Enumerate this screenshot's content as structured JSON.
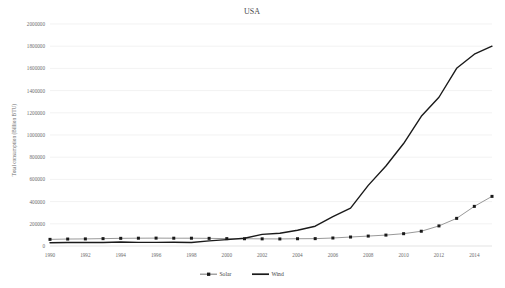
{
  "chart_data": {
    "type": "line",
    "title": "USA",
    "xlabel": "",
    "ylabel": "Total consumption (Billion BTU)",
    "x": [
      1990,
      1991,
      1992,
      1993,
      1994,
      1995,
      1996,
      1997,
      1998,
      1999,
      2000,
      2001,
      2002,
      2003,
      2004,
      2005,
      2006,
      2007,
      2008,
      2009,
      2010,
      2011,
      2012,
      2013,
      2014,
      2015
    ],
    "xtick_labels": [
      "1990",
      "1992",
      "1994",
      "1996",
      "1998",
      "2000",
      "2002",
      "2004",
      "2006",
      "2008",
      "2010",
      "2012",
      "2014"
    ],
    "ytick_labels": [
      "0",
      "200000",
      "400000",
      "600000",
      "800000",
      "1000000",
      "1200000",
      "1400000",
      "1600000",
      "1800000",
      "2000000"
    ],
    "ytick_values": [
      0,
      200000,
      400000,
      600000,
      800000,
      1000000,
      1200000,
      1400000,
      1600000,
      1800000,
      2000000
    ],
    "ylim": [
      0,
      2000000
    ],
    "xlim": [
      1990,
      2015
    ],
    "grid": true,
    "legend_position": "bottom",
    "series": [
      {
        "name": "Solar",
        "color": "#8c8c8c",
        "marker": "square",
        "marker_color": "#1a1a1a",
        "line_width": 0.9,
        "values": [
          59718,
          62688,
          63886,
          66388,
          69040,
          70237,
          71080,
          70237,
          70185,
          68793,
          66388,
          65454,
          64391,
          63595,
          65454,
          66388,
          72000,
          80906,
          89429,
          98263,
          111000,
          133000,
          181000,
          249000,
          357000,
          447000
        ]
      },
      {
        "name": "Wind",
        "color": "#1a1a1a",
        "marker": "none",
        "marker_color": "#1a1a1a",
        "line_width": 1.4,
        "values": [
          29000,
          31000,
          33000,
          31000,
          36000,
          33000,
          33000,
          34000,
          31000,
          46000,
          57000,
          70000,
          105000,
          115000,
          142000,
          178000,
          264000,
          341000,
          546000,
          721000,
          923000,
          1168000,
          1340000,
          1601000,
          1728000,
          1800000
        ]
      }
    ]
  },
  "legend": {
    "items": [
      {
        "label": "Solar"
      },
      {
        "label": "Wind"
      }
    ]
  }
}
